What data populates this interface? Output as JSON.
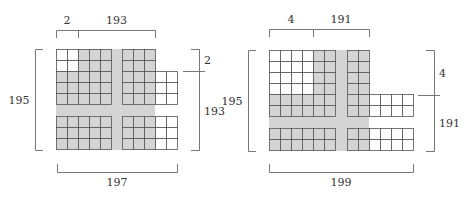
{
  "colors": {
    "shade": "#d4d4d4",
    "grid_line": "#555555",
    "bracket": "#777777",
    "text": "#333333"
  },
  "cell": 11,
  "figures": [
    {
      "name": "left-figure",
      "labels": {
        "top_left": "2",
        "top_right": "193",
        "left": "195",
        "right_top": "2",
        "right_bottom": "193",
        "bottom": "197"
      },
      "shaded_regions": [
        {
          "x": 56,
          "y": 49,
          "w": 99,
          "h": 101
        }
      ],
      "blocks": [
        {
          "x": 56,
          "y": 49,
          "cols": 5,
          "rows": 5,
          "white_cells": [
            [
              0,
              0
            ],
            [
              1,
              0
            ],
            [
              0,
              1
            ],
            [
              1,
              1
            ]
          ]
        },
        {
          "x": 122,
          "y": 49,
          "cols": 3,
          "rows": 5,
          "white_cells": []
        },
        {
          "x": 155,
          "y": 71,
          "cols": 2,
          "rows": 3,
          "white_cells": "all"
        },
        {
          "x": 56,
          "y": 116,
          "cols": 5,
          "rows": 3,
          "white_cells": []
        },
        {
          "x": 122,
          "y": 116,
          "cols": 3,
          "rows": 3,
          "white_cells": []
        },
        {
          "x": 155,
          "y": 116,
          "cols": 2,
          "rows": 3,
          "white_cells": "all"
        }
      ],
      "brackets": {
        "top": {
          "y": 30,
          "x1": 56,
          "xm": 78,
          "x2": 155,
          "label_y": 24
        },
        "left": {
          "x": 35,
          "y1": 49,
          "y2": 150,
          "label_x": 19
        },
        "right": {
          "x": 199,
          "y1": 49,
          "ym": 71,
          "y2": 150,
          "label_x": 204
        },
        "bottom": {
          "y": 172,
          "x1": 57,
          "x2": 177,
          "label_y": 186
        }
      }
    },
    {
      "name": "right-figure",
      "labels": {
        "top_left": "4",
        "top_right": "191",
        "left": "195",
        "right_top": "4",
        "right_bottom": "191",
        "bottom": "199"
      },
      "shaded_regions": [
        {
          "x": 302,
          "y": 50,
          "w": 67,
          "h": 101
        },
        {
          "x": 269,
          "y": 94,
          "w": 100,
          "h": 34
        }
      ],
      "blocks": [
        {
          "x": 269,
          "y": 50,
          "cols": 4,
          "rows": 4,
          "white_cells": "all"
        },
        {
          "x": 313,
          "y": 50,
          "cols": 2,
          "rows": 4,
          "white_cells": []
        },
        {
          "x": 269,
          "y": 94,
          "cols": 6,
          "rows": 2,
          "white_cells": []
        },
        {
          "x": 347,
          "y": 50,
          "cols": 2,
          "rows": 6,
          "white_cells": []
        },
        {
          "x": 369,
          "y": 94,
          "cols": 4,
          "rows": 2,
          "white_cells": "all"
        },
        {
          "x": 269,
          "y": 128,
          "cols": 6,
          "rows": 2,
          "white_cells": []
        },
        {
          "x": 347,
          "y": 128,
          "cols": 2,
          "rows": 2,
          "white_cells": []
        },
        {
          "x": 369,
          "y": 128,
          "cols": 4,
          "rows": 2,
          "white_cells": "all"
        }
      ],
      "brackets": {
        "top": {
          "y": 29,
          "x1": 269,
          "xm": 313,
          "x2": 369,
          "label_y": 23
        },
        "left": {
          "x": 248,
          "y1": 50,
          "y2": 151,
          "label_x": 232
        },
        "right": {
          "x": 434,
          "y1": 50,
          "ym": 95,
          "y2": 151,
          "label_x": 439
        },
        "bottom": {
          "y": 172,
          "x1": 269,
          "x2": 413,
          "label_y": 186
        }
      }
    }
  ]
}
